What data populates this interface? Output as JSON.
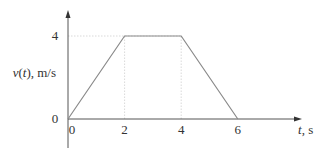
{
  "chart_data": {
    "type": "line",
    "title": "",
    "xlabel": "t, s",
    "ylabel": "v(t), m/s",
    "x": [
      0,
      2,
      4,
      6
    ],
    "series": [
      {
        "name": "v(t)",
        "values": [
          0,
          4,
          4,
          0
        ]
      }
    ],
    "xticks": [
      "0",
      "2",
      "4",
      "6"
    ],
    "yticks": [
      "0",
      "4"
    ],
    "xlim": [
      0,
      8.2
    ],
    "ylim": [
      0,
      5
    ],
    "grid": false,
    "guides": [
      {
        "type": "horizontal",
        "y": 4,
        "x_from": 0,
        "x_to": 4
      },
      {
        "type": "vertical",
        "x": 2,
        "y_from": 0,
        "y_to": 4
      },
      {
        "type": "vertical",
        "x": 4,
        "y_from": 0,
        "y_to": 4
      }
    ],
    "colors": {
      "line": "#8a8a8a",
      "axis": "#555555",
      "guide": "#cfcfcf"
    }
  }
}
